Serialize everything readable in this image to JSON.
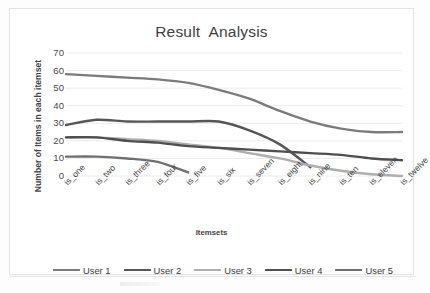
{
  "chart_data": {
    "type": "line",
    "title": "Result  Analysis",
    "xlabel": "Itemsets",
    "ylabel": "Number of Items in each  itemset",
    "categories": [
      "is_one",
      "is_two",
      "is_three",
      "is_four",
      "is_five",
      "is_six",
      "is_seven",
      "is_eight",
      "is_nine",
      "is_ten",
      "is_eleven",
      "is_twelve"
    ],
    "ylim": [
      0,
      70
    ],
    "yticks": [
      0,
      10,
      20,
      30,
      40,
      50,
      60,
      70
    ],
    "grid": true,
    "legend_position": "bottom",
    "series": [
      {
        "name": "User 1",
        "color": "#7b7b7b",
        "values": [
          58,
          57,
          56,
          55,
          53,
          49,
          44,
          37,
          31,
          27,
          25,
          25
        ]
      },
      {
        "name": "User 2",
        "color": "#565656",
        "values": [
          29,
          32,
          31,
          31,
          31,
          31,
          26,
          18,
          5,
          null,
          null,
          null
        ]
      },
      {
        "name": "User 3",
        "color": "#aeaeae",
        "values": [
          22,
          22,
          21,
          20,
          18,
          16,
          13,
          10,
          6,
          3,
          1,
          0
        ]
      },
      {
        "name": "User 4",
        "color": "#4f4f4f",
        "values": [
          22,
          22,
          20,
          19,
          17,
          16,
          15,
          14,
          13,
          12,
          10,
          9
        ]
      },
      {
        "name": "User 5",
        "color": "#6f6f6f",
        "values": [
          11,
          11,
          10,
          8,
          2,
          null,
          null,
          null,
          null,
          null,
          null,
          null
        ]
      }
    ]
  },
  "legend": {
    "items": [
      {
        "label": "User 1"
      },
      {
        "label": "User 2"
      },
      {
        "label": "User 3"
      },
      {
        "label": "User 4"
      },
      {
        "label": "User 5"
      }
    ]
  },
  "style": {
    "grid_color": "#e6e6e6",
    "frame_color": "#e3e3e3",
    "background": "#ffffff",
    "text_color": "#3f3f3f"
  }
}
